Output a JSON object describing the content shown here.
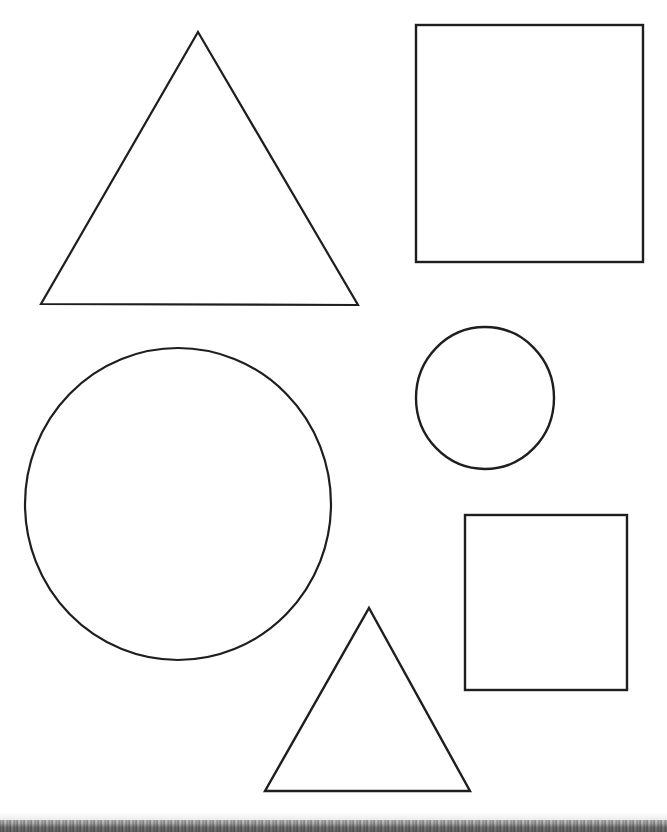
{
  "page": {
    "width": 667,
    "height": 832,
    "background_color": "#ffffff",
    "stroke_color": "#1e1e1e"
  },
  "artifacts": {
    "bottom_scan_edge": {
      "label": "scanner paper edge noise band",
      "color": "#8c8c8c",
      "y_start": 820,
      "height": 12
    }
  },
  "shapes": [
    {
      "id": "triangle-large",
      "name": "Large Triangle",
      "type": "triangle",
      "stroke_width": 2.2,
      "points": "198,32 358,305 41,304",
      "bbox": [
        41,
        32,
        317,
        273
      ]
    },
    {
      "id": "rectangle-large",
      "name": "Large Rectangle",
      "type": "rectangle",
      "stroke_width": 2.4,
      "x": 416,
      "y": 25,
      "width": 227,
      "height": 237
    },
    {
      "id": "circle-large",
      "name": "Large Circle",
      "type": "circle",
      "stroke_width": 2.2,
      "cx": 178,
      "cy": 504,
      "rx": 153,
      "ry": 156
    },
    {
      "id": "circle-small",
      "name": "Small Circle",
      "type": "circle",
      "stroke_width": 2.4,
      "cx": 485,
      "cy": 398,
      "rx": 69,
      "ry": 71
    },
    {
      "id": "rectangle-small",
      "name": "Small Rectangle",
      "type": "rectangle",
      "stroke_width": 2.4,
      "x": 465,
      "y": 515,
      "width": 162,
      "height": 175
    },
    {
      "id": "triangle-small",
      "name": "Small Triangle",
      "type": "triangle",
      "stroke_width": 2.4,
      "points": "369,608 470,791 265,791",
      "bbox": [
        265,
        608,
        205,
        183
      ]
    }
  ]
}
